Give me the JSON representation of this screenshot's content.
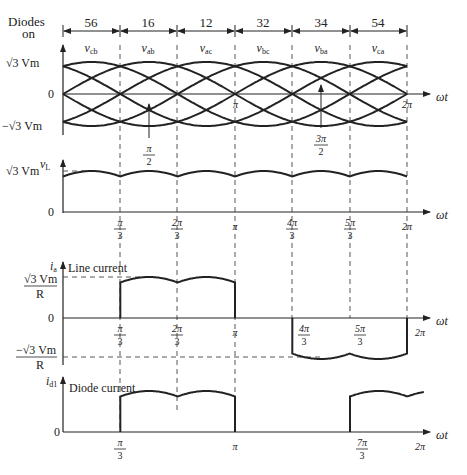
{
  "header": {
    "diodes_label_line1": "Diodes",
    "diodes_label_line2": "on",
    "intervals": [
      "56",
      "16",
      "12",
      "32",
      "34",
      "54"
    ],
    "voltage_labels": [
      "v_cb",
      "v_ab",
      "v_ac",
      "v_bc",
      "v_ba",
      "v_ca"
    ]
  },
  "plot1": {
    "y_labels": {
      "top": "√3 Vm",
      "zero": "0",
      "bottom": "−√3 Vm"
    },
    "x_labels": {
      "pi": "π",
      "two_pi": "2π",
      "omega_t": "ωt"
    },
    "annotations": [
      {
        "num": "π",
        "den": "2"
      },
      {
        "num": "3π",
        "den": "2"
      }
    ]
  },
  "plot2": {
    "y_axis_label": "vL",
    "y_labels": {
      "top": "√3 Vm",
      "zero": "0"
    },
    "x_ticks": [
      {
        "num": "π",
        "den": "3"
      },
      {
        "num": "2π",
        "den": "3"
      },
      {
        "single": "π"
      },
      {
        "num": "4π",
        "den": "3"
      },
      {
        "num": "5π",
        "den": "3"
      },
      {
        "single": "2π"
      }
    ],
    "omega_t": "ωt"
  },
  "plot3": {
    "y_axis_label": "ia",
    "title": "Line current",
    "y_labels": {
      "top_num": "√3 Vm",
      "top_den": "R",
      "zero": "0",
      "bot_num": "−√3 Vm",
      "bot_den": "R"
    },
    "x_ticks": [
      {
        "num": "π",
        "den": "3"
      },
      {
        "num": "2π",
        "den": "3"
      },
      {
        "single": "π"
      },
      {
        "num": "4π",
        "den": "3"
      },
      {
        "num": "5π",
        "den": "3"
      },
      {
        "single": "2π"
      }
    ],
    "omega_t": "ωt"
  },
  "plot4": {
    "y_axis_label": "id1",
    "title": "Diode current",
    "y_labels": {
      "zero": "0"
    },
    "x_ticks": [
      {
        "num": "π",
        "den": "3"
      },
      {
        "single": "π"
      },
      {
        "num": "7π",
        "den": "3"
      },
      {
        "single": "2π"
      }
    ],
    "omega_t": "ωt"
  },
  "chart_data": {
    "type": "line",
    "x_unit": "ωt (rad)",
    "x_ticks": [
      "π/3",
      "2π/3",
      "π",
      "4π/3",
      "5π/3",
      "2π"
    ],
    "diode_pairs": [
      "56",
      "16",
      "12",
      "32",
      "34",
      "54"
    ],
    "line_voltages": [
      "v_cb",
      "v_ab",
      "v_ac",
      "v_bc",
      "v_ba",
      "v_ca"
    ],
    "panels": [
      {
        "name": "Line-to-line voltages",
        "ylim": [
          "-√3Vm",
          "√3Vm"
        ],
        "series": [
          "v_ab",
          "v_bc",
          "v_ca",
          "v_ba",
          "v_cb",
          "v_ac"
        ]
      },
      {
        "name": "Output voltage vL",
        "ylim": [
          0,
          "√3Vm"
        ],
        "description": "six-pulse ripple, peaks at √3Vm, minima at 1.5Vm at multiples of π/3"
      },
      {
        "name": "Line current ia",
        "ylim": [
          "-√3Vm/R",
          "√3Vm/R"
        ],
        "description": "positive two-pulse from π/3 to π, zero π to 4π/3, negative two-pulse 4π/3 to 2π"
      },
      {
        "name": "Diode current id1",
        "ylim": [
          0,
          "√3Vm/R"
        ],
        "description": "conducts π/3 to π and again from 7π/3"
      }
    ]
  }
}
